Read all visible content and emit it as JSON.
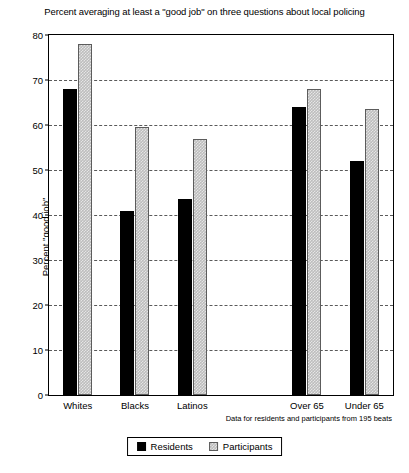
{
  "chart_data": {
    "type": "bar",
    "title": "Percent averaging at least a \"good job\" on three questions about local policing",
    "xlabel": "",
    "ylabel": "Percent \"good job\"",
    "ylim": [
      0,
      80
    ],
    "ytick_step": 10,
    "yticks": [
      0,
      10,
      20,
      30,
      40,
      50,
      60,
      70,
      80
    ],
    "grid": "horizontal-dashed",
    "legend_position": "bottom-center",
    "categories": [
      "Whites",
      "Blacks",
      "Latinos",
      "Over 65",
      "Under 65"
    ],
    "series": [
      {
        "name": "Residents",
        "color": "#000000",
        "values": [
          68,
          41,
          43.5,
          64,
          52
        ]
      },
      {
        "name": "Participants",
        "color": "#bdbdbd",
        "values": [
          78,
          59.5,
          57,
          68,
          63.5
        ]
      }
    ],
    "annotation": "Data for residents and participants from 195 beats",
    "group_gap_after": "Latinos"
  },
  "legend": {
    "entries": [
      {
        "label": "Residents"
      },
      {
        "label": "Participants"
      }
    ]
  }
}
